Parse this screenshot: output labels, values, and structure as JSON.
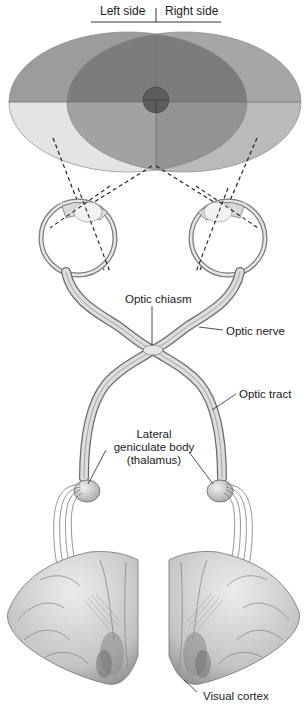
{
  "header": {
    "left_label": "Left side",
    "right_label": "Right side"
  },
  "labels": {
    "optic_chiasm": "Optic chiasm",
    "optic_nerve": "Optic nerve",
    "optic_tract": "Optic tract",
    "lgb_line1": "Lateral",
    "lgb_line2": "geniculate body",
    "lgb_line3": "(thalamus)",
    "visual_cortex": "Visual cortex"
  },
  "colors": {
    "left_field_upper": "#9a9a9a",
    "left_field_lower": "#e2e2e2",
    "right_field_upper": "#a8a8a8",
    "right_field_lower": "#bdbdbd",
    "overlap": "#7a7a7a",
    "fovea": "#555555",
    "nerve_fill": "#dcdcdc",
    "nerve_stroke": "#6a6a6a",
    "cortex_fill": "#cfcfcf",
    "cortex_shadow": "#8a8a8a"
  }
}
